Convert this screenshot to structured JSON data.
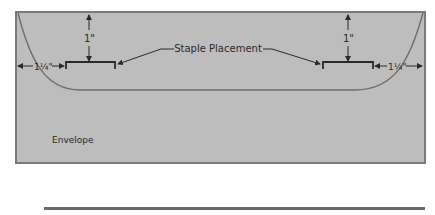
{
  "diagram": {
    "title_label": "Staple Placement",
    "envelope_label": "Envelope",
    "top_margin_left": "1\"",
    "top_margin_right": "1\"",
    "side_margin_left": "1¼\"",
    "side_margin_right": "1¼\"",
    "colors": {
      "envelope_fill": "#bdbdbd",
      "envelope_border": "#7a7a7a",
      "line": "#3a3a3a",
      "curve": "#6e6e6e",
      "rule": "#6a6a6a"
    }
  }
}
